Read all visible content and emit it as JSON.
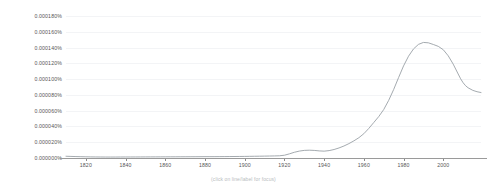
{
  "chart_data": {
    "type": "line",
    "title": "",
    "subtitle": "",
    "xlabel": "",
    "ylabel": "",
    "xlim": [
      1810,
      2019
    ],
    "ylim": [
      0.0,
      0.00018
    ],
    "grid": true,
    "legend_position": "right-end-of-line",
    "y_tick_labels": [
      "0.000180%",
      "0.000160%",
      "0.000140%",
      "0.000120%",
      "0.000100%",
      "0.000080%",
      "0.000060%",
      "0.000040%",
      "0.000020%",
      "0.000000%"
    ],
    "y_tick_values": [
      0.00018,
      0.00016,
      0.00014,
      0.00012,
      0.0001,
      8e-05,
      6e-05,
      4e-05,
      2e-05,
      0.0
    ],
    "x_tick_labels": [
      "1820",
      "1840",
      "1860",
      "1880",
      "1900",
      "1920",
      "1940",
      "1960",
      "1980",
      "2000"
    ],
    "x_tick_values": [
      1820,
      1840,
      1860,
      1880,
      1900,
      1920,
      1940,
      1960,
      1980,
      2000
    ],
    "series": [
      {
        "name": "comparative advantage",
        "label_lines": [
          "comparative",
          "advantage"
        ],
        "color": "#9aa0a6",
        "x": [
          1810,
          1815,
          1820,
          1825,
          1830,
          1835,
          1840,
          1845,
          1850,
          1855,
          1860,
          1865,
          1870,
          1875,
          1880,
          1885,
          1890,
          1895,
          1900,
          1905,
          1910,
          1915,
          1920,
          1925,
          1930,
          1935,
          1940,
          1945,
          1950,
          1955,
          1960,
          1965,
          1970,
          1975,
          1980,
          1985,
          1990,
          1995,
          2000,
          2005,
          2010,
          2015,
          2019
        ],
        "values": [
          2.2e-06,
          1.8e-06,
          1.5e-06,
          1.3e-06,
          1.2e-06,
          1.2e-06,
          1.3e-06,
          1.3e-06,
          1.4e-06,
          1.4e-06,
          1.5e-06,
          1.5e-06,
          1.6e-06,
          1.6e-06,
          1.7e-06,
          1.7e-06,
          1.8e-06,
          1.9e-06,
          2e-06,
          2.2e-06,
          2.4e-06,
          2.6e-06,
          3e-06,
          7.5e-06,
          1e-05,
          9.8e-06,
          8.2e-06,
          1.05e-05,
          1.5e-05,
          2.15e-05,
          3e-05,
          4.5e-05,
          6e-05,
          8.6e-05,
          0.000118,
          0.00014,
          0.000148,
          0.000144,
          0.000139,
          0.00012,
          9.3e-05,
          8.5e-05,
          8.3e-05
        ]
      }
    ]
  },
  "footer": {
    "focus_hint": "(click on line/label for focus)"
  }
}
